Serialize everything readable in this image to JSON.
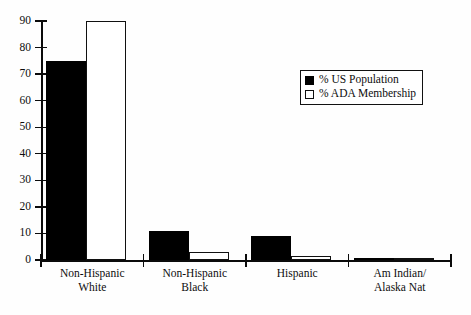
{
  "chart_data": {
    "type": "bar",
    "title": "",
    "xlabel": "",
    "ylabel": "",
    "ylim": [
      0,
      90
    ],
    "ytick_step": 10,
    "grid": false,
    "legend_position": "upper-right-inside",
    "categories": [
      "Non-Hispanic White",
      "Non-Hispanic Black",
      "Hispanic",
      "Am Indian/ Alaska Nat"
    ],
    "category_lines": [
      [
        "Non-Hispanic",
        "White"
      ],
      [
        "Non-Hispanic",
        "Black"
      ],
      [
        "Hispanic",
        ""
      ],
      [
        "Am Indian/",
        "Alaska Nat"
      ]
    ],
    "ytick_labels": [
      "90",
      "80",
      "70",
      "60",
      "50",
      "40",
      "30",
      "20",
      "10",
      "0"
    ],
    "ytick_values": [
      90,
      80,
      70,
      60,
      50,
      40,
      30,
      20,
      10,
      0
    ],
    "series": [
      {
        "name": "% US Population",
        "swatch": "dark",
        "color": "#000000",
        "values": [
          75,
          11,
          9,
          0.6
        ]
      },
      {
        "name": "% ADA Membership",
        "swatch": "light",
        "color": "#ffffff",
        "values": [
          90,
          3,
          1.5,
          0.2
        ]
      }
    ]
  },
  "legend": {
    "items": [
      {
        "label": "% US Population",
        "swatch": "dark"
      },
      {
        "label": "% ADA Membership",
        "swatch": "light"
      }
    ]
  },
  "axes": {
    "y_max": 90,
    "y_min": 0
  }
}
